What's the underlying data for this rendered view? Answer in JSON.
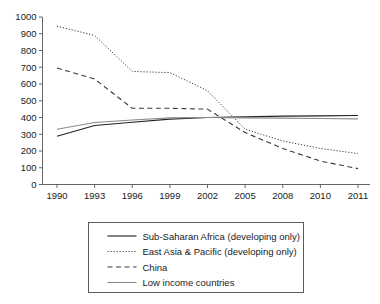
{
  "chart_data": {
    "type": "line",
    "title": "",
    "subtitle": "",
    "xlabel": "",
    "ylabel": "",
    "x": [
      1990,
      1993,
      1996,
      1999,
      2002,
      2005,
      2008,
      2010,
      2011
    ],
    "x_tick_labels": [
      "1990",
      "1993",
      "1996",
      "1999",
      "2002",
      "2005",
      "2008",
      "2010",
      "2011"
    ],
    "y_tick_labels": [
      "0",
      "100",
      "200",
      "300",
      "400",
      "500",
      "600",
      "700",
      "800",
      "900",
      "1000"
    ],
    "y_ticks": [
      0,
      100,
      200,
      300,
      400,
      500,
      600,
      700,
      800,
      900,
      1000
    ],
    "ylim": [
      0,
      1000
    ],
    "grid": false,
    "legend_position": "below-axes",
    "series": [
      {
        "name": "Sub-Saharan Africa (developing only)",
        "style": "solid",
        "color": "#222222",
        "width": 1.1,
        "values": [
          288,
          352,
          372,
          390,
          400,
          404,
          408,
          410,
          412
        ]
      },
      {
        "name": "East Asia & Pacific (developing only)",
        "style": "dotted",
        "color": "#3a3a3a",
        "width": 1.0,
        "values": [
          945,
          890,
          675,
          668,
          560,
          330,
          260,
          215,
          185
        ]
      },
      {
        "name": "China",
        "style": "dashed",
        "color": "#3a3a3a",
        "width": 1.1,
        "values": [
          695,
          630,
          455,
          455,
          450,
          310,
          215,
          140,
          95
        ]
      },
      {
        "name": "Low income countries",
        "style": "solid",
        "color": "#8a8a8a",
        "width": 1.1,
        "values": [
          330,
          370,
          385,
          398,
          400,
          398,
          396,
          394,
          392
        ]
      }
    ]
  },
  "legend": {
    "entries": [
      {
        "label": "Sub-Saharan Africa (developing only)"
      },
      {
        "label": "East Asia & Pacific (developing only)"
      },
      {
        "label": "China"
      },
      {
        "label": "Low income countries"
      }
    ]
  }
}
